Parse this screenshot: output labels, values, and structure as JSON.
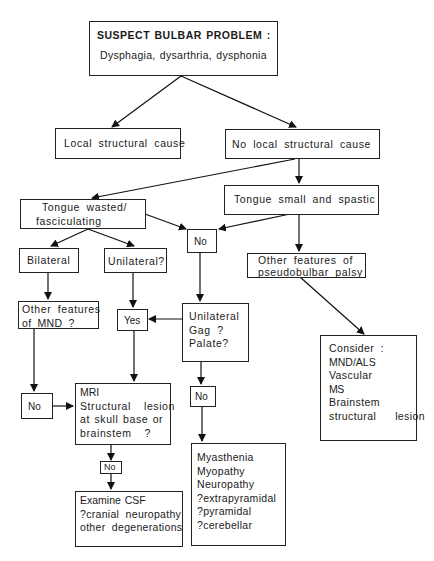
{
  "diagram": {
    "type": "flowchart",
    "nodes": {
      "start": {
        "title": "SUSPECT BULBAR PROBLEM :",
        "subtitle": "Dysphagia, dysarthria, dysphonia"
      },
      "local": {
        "label": "Local structural cause"
      },
      "no_local": {
        "label": "No local structural cause"
      },
      "tongue_spastic": {
        "label": "Tongue small and spastic"
      },
      "tongue_wasted": {
        "lines": [
          "Tongue wasted/",
          "fasciculating"
        ]
      },
      "no_mid": {
        "label": "No"
      },
      "bilateral": {
        "label": "Bilateral"
      },
      "unilateral_q": {
        "label": "Unilateral?"
      },
      "pseudobulbar": {
        "lines": [
          "Other features of",
          "pseudobulbar palsy"
        ]
      },
      "mnd_features": {
        "lines": [
          "Other features",
          "of MND ?"
        ]
      },
      "yes": {
        "label": "Yes"
      },
      "gag_palate": {
        "lines": [
          "Unilateral",
          "Gag ?",
          "Palate?"
        ]
      },
      "consider": {
        "lines": [
          "Consider :",
          "MND/ALS",
          "Vascular",
          "MS",
          "Brainstem",
          "structural   lesion"
        ]
      },
      "no_left": {
        "label": "No"
      },
      "mri": {
        "lines": [
          "MRI",
          "Structural  lesion",
          "at skull base or",
          "brainstem  ?"
        ]
      },
      "no_right": {
        "label": "No"
      },
      "no_small": {
        "label": "No"
      },
      "csf": {
        "lines": [
          "Examine CSF",
          "?cranial  neuropathy",
          "other  degenerations"
        ]
      },
      "myasthenia": {
        "lines": [
          "Myasthenia",
          "Myopathy",
          "Neuropathy",
          "?extrapyramidal",
          "?pyramidal",
          "?cerebellar"
        ]
      }
    }
  }
}
